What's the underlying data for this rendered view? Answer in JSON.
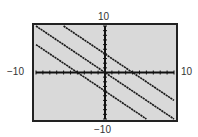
{
  "chart_data": {
    "type": "line",
    "title": "",
    "xlabel": "",
    "ylabel": "",
    "xlim": [
      -10,
      10
    ],
    "ylim": [
      -10,
      10
    ],
    "x_tick_step": 1,
    "y_tick_step": 1,
    "grid": false,
    "legend": null,
    "window_labels": {
      "xmin": "−10",
      "xmax": "10",
      "ymin": "−10",
      "ymax": "10"
    },
    "series": [
      {
        "name": "upper line",
        "equation": "y = -x + 4",
        "slope": -1,
        "intercept": 4,
        "x": [
          -6,
          10
        ],
        "y": [
          10,
          -6
        ]
      },
      {
        "name": "middle line",
        "equation": "y = -x",
        "slope": -1,
        "intercept": 0,
        "x": [
          -10,
          10
        ],
        "y": [
          10,
          -10
        ]
      },
      {
        "name": "lower line",
        "equation": "y = -x - 4",
        "slope": -1,
        "intercept": -4,
        "x": [
          -10,
          6
        ],
        "y": [
          6,
          -10
        ]
      }
    ]
  },
  "colors": {
    "background": "#d9d9d9",
    "frame": "#222222",
    "line": "#1a1a1a",
    "axis": "#111111"
  }
}
